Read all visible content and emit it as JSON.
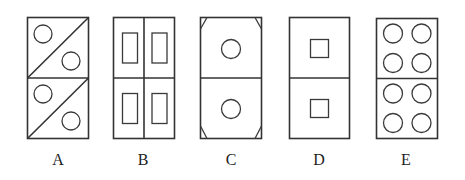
{
  "figure": {
    "stroke_color": "#333333",
    "background": "#ffffff"
  },
  "options": [
    {
      "label": "A",
      "content": "each half split by a diagonal from bottom-left to top-right, with one circle in each triangle (upper-left and lower-right)"
    },
    {
      "label": "B",
      "content": "vertically and horizontally divided into four cells, each containing a tall small rectangle"
    },
    {
      "label": "C",
      "content": "each half contains a centered circle; corner triangles cut off at the four outer corners"
    },
    {
      "label": "D",
      "content": "each half contains a centered small square"
    },
    {
      "label": "E",
      "content": "each half contains four circles in a 2x2 grid"
    }
  ]
}
